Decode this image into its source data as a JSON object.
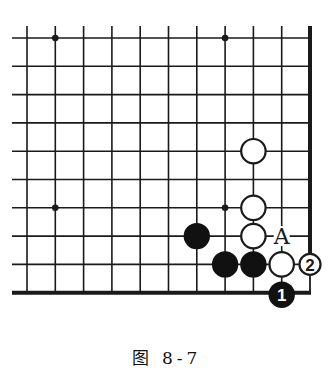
{
  "diagram": {
    "type": "go-board-corner",
    "caption": "图 8-7",
    "colors": {
      "line": "#1a1a1a",
      "black_stone": "#111111",
      "white_stone": "#ffffff",
      "background": "#ffffff"
    },
    "grid": {
      "columns": 11,
      "rows": 10,
      "edges": [
        "right",
        "bottom"
      ]
    },
    "star_points": [
      {
        "col": 1,
        "row": 0
      },
      {
        "col": 7,
        "row": 0
      },
      {
        "col": 1,
        "row": 6
      },
      {
        "col": 7,
        "row": 6
      }
    ],
    "stones": [
      {
        "color": "white",
        "col": 8,
        "row": 4,
        "label": ""
      },
      {
        "color": "white",
        "col": 8,
        "row": 6,
        "label": ""
      },
      {
        "color": "white",
        "col": 8,
        "row": 7,
        "label": ""
      },
      {
        "color": "black",
        "col": 6,
        "row": 7,
        "label": ""
      },
      {
        "color": "black",
        "col": 7,
        "row": 8,
        "label": ""
      },
      {
        "color": "black",
        "col": 8,
        "row": 8,
        "label": ""
      },
      {
        "color": "white",
        "col": 9,
        "row": 8,
        "label": ""
      },
      {
        "color": "white",
        "col": 10,
        "row": 8,
        "label": "2"
      },
      {
        "color": "black",
        "col": 9,
        "row": 9,
        "label": "1"
      }
    ],
    "markers": [
      {
        "text": "A",
        "col": 9,
        "row": 7
      }
    ]
  }
}
